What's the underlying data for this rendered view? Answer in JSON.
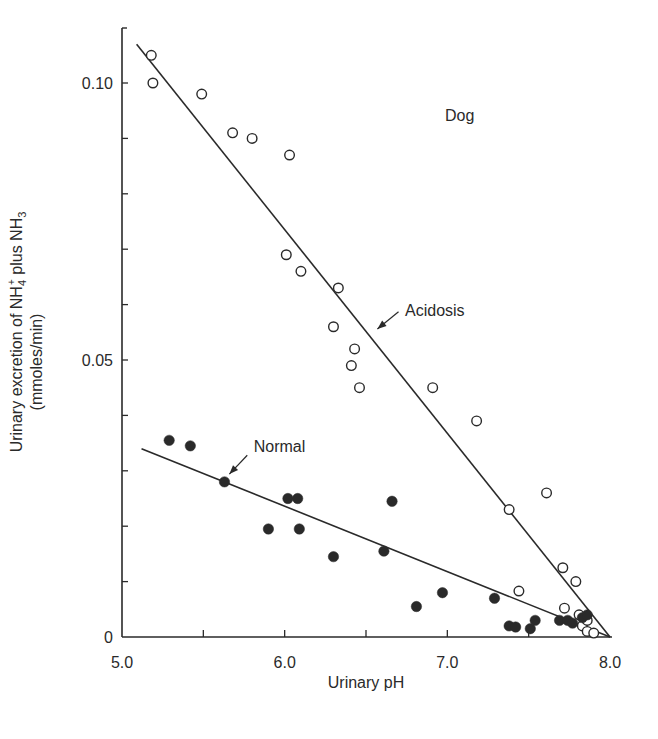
{
  "chart_data": {
    "type": "scatter",
    "title": "",
    "annotation_title": "Dog",
    "xlabel": "Urinary pH",
    "ylabel_line1_parts": [
      "Urinary excretion of NH",
      "4",
      "+",
      " plus NH",
      "3"
    ],
    "ylabel_line2": "(mmoles/min)",
    "xlim": [
      5.0,
      8.0
    ],
    "ylim": [
      0,
      0.11
    ],
    "x_ticks": [
      5.0,
      5.5,
      6.0,
      6.5,
      7.0,
      7.5,
      8.0
    ],
    "x_tick_labels": [
      {
        "value": 5.0,
        "label": "5.0"
      },
      {
        "value": 6.0,
        "label": "6.0"
      },
      {
        "value": 7.0,
        "label": "7.0"
      },
      {
        "value": 8.0,
        "label": "8.0"
      }
    ],
    "y_ticks": [
      0,
      0.01,
      0.02,
      0.03,
      0.04,
      0.05,
      0.06,
      0.07,
      0.08,
      0.09,
      0.1
    ],
    "y_tick_labels": [
      {
        "value": 0,
        "label": "0"
      },
      {
        "value": 0.05,
        "label": "0.05"
      },
      {
        "value": 0.1,
        "label": "0.10"
      }
    ],
    "grid": false,
    "legend": "none (inline labels with arrows)",
    "series": [
      {
        "name": "Acidosis",
        "marker": "open-circle",
        "points": [
          [
            5.18,
            0.105
          ],
          [
            5.19,
            0.1
          ],
          [
            5.49,
            0.098
          ],
          [
            5.68,
            0.091
          ],
          [
            5.8,
            0.09
          ],
          [
            6.03,
            0.087
          ],
          [
            6.01,
            0.069
          ],
          [
            6.1,
            0.066
          ],
          [
            6.33,
            0.063
          ],
          [
            6.3,
            0.056
          ],
          [
            6.43,
            0.052
          ],
          [
            6.41,
            0.049
          ],
          [
            6.46,
            0.045
          ],
          [
            6.91,
            0.045
          ],
          [
            7.18,
            0.039
          ],
          [
            7.61,
            0.026
          ],
          [
            7.38,
            0.023
          ],
          [
            7.71,
            0.0125
          ],
          [
            7.79,
            0.01
          ],
          [
            7.44,
            0.0083
          ],
          [
            7.72,
            0.0052
          ],
          [
            7.81,
            0.004
          ],
          [
            7.83,
            0.002
          ],
          [
            7.86,
            0.003
          ],
          [
            7.86,
            0.001
          ],
          [
            7.9,
            0.0007
          ]
        ],
        "fit_line": {
          "from": [
            5.09,
            0.107
          ],
          "to": [
            8.0,
            0.0
          ]
        },
        "label": {
          "text": "Acidosis",
          "x": 6.74,
          "y": 0.058
        },
        "arrow": {
          "from": [
            6.7,
            0.0587
          ],
          "to": [
            6.57,
            0.0556
          ]
        }
      },
      {
        "name": "Normal",
        "marker": "filled-circle",
        "points": [
          [
            5.29,
            0.0355
          ],
          [
            5.42,
            0.0345
          ],
          [
            5.63,
            0.028
          ],
          [
            6.02,
            0.025
          ],
          [
            6.08,
            0.025
          ],
          [
            5.9,
            0.0195
          ],
          [
            6.09,
            0.0195
          ],
          [
            6.3,
            0.0145
          ],
          [
            6.66,
            0.0245
          ],
          [
            6.61,
            0.0155
          ],
          [
            6.81,
            0.0055
          ],
          [
            6.97,
            0.008
          ],
          [
            7.29,
            0.007
          ],
          [
            7.38,
            0.002
          ],
          [
            7.42,
            0.0018
          ],
          [
            7.51,
            0.0015
          ],
          [
            7.54,
            0.003
          ],
          [
            7.69,
            0.003
          ],
          [
            7.74,
            0.003
          ],
          [
            7.77,
            0.0025
          ],
          [
            7.83,
            0.0035
          ],
          [
            7.86,
            0.004
          ]
        ],
        "fit_line": {
          "from": [
            5.12,
            0.034
          ],
          "to": [
            8.0,
            0.0
          ]
        },
        "label": {
          "text": "Normal",
          "x": 5.81,
          "y": 0.0334
        },
        "arrow": {
          "from": [
            5.77,
            0.0328
          ],
          "to": [
            5.66,
            0.0294
          ]
        }
      }
    ]
  },
  "colors": {
    "ink": "#2a2a2a",
    "background": "#ffffff"
  }
}
